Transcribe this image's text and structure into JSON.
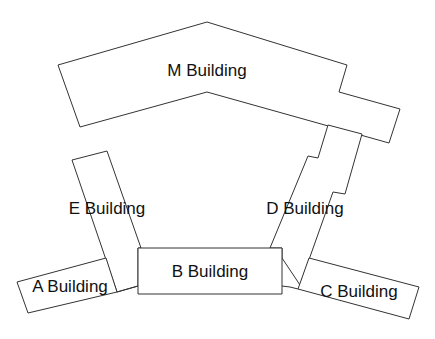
{
  "diagram": {
    "type": "campus-map",
    "stroke_color": "#333333",
    "background": "#ffffff",
    "buildings": [
      {
        "id": "M",
        "label": "M Building",
        "points": "58,65 207,22 347,65 339,92 400,109 389,143 207,92 80,127",
        "label_x": 207,
        "label_y": 76
      },
      {
        "id": "D",
        "label": "D Building",
        "points": "328,125 318,158 308,156 270,248 282,248 282,258 300,285 333,192 345,194 362,134",
        "label_x": 305,
        "label_y": 214
      },
      {
        "id": "E",
        "label": "E Building",
        "points": "72,160 107,151 141,248 138,248 138,286 117,292",
        "label_x": 107,
        "label_y": 214
      },
      {
        "id": "B",
        "label": "B Building",
        "points": "138,248 282,248 282,294 138,294",
        "label_x": 210,
        "label_y": 277
      },
      {
        "id": "A",
        "label": "A Building",
        "points": "17,282 106,258 117,292 28,313",
        "label_x": 70,
        "label_y": 292
      },
      {
        "id": "C",
        "label": "C Building",
        "points": "309,258 419,287 409,319 298,289",
        "label_x": 359,
        "label_y": 297
      }
    ],
    "connectors": [
      {
        "from": "A",
        "to": "B",
        "points": "117,292 124,290 138,286"
      },
      {
        "from": "B",
        "to": "C",
        "points": "282,286 290,287 298,289"
      }
    ]
  }
}
